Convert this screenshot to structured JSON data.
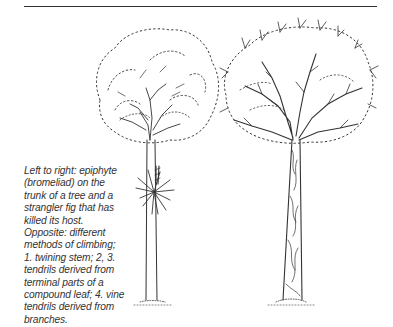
{
  "page": {
    "caption": {
      "lines": [
        "Left to right: epiphyte",
        "(bromeliad) on the",
        "trunk of a tree and a",
        "strangler fig that has",
        "killed its host.",
        "Opposite: different",
        "methods of climbing;",
        "1. twining stem; 2, 3.",
        "tendrils derived from",
        "terminal parts of a",
        "compound leaf; 4. vine",
        "tendrils derived from",
        "branches."
      ]
    },
    "illustration": {
      "left_tree": "tree-with-bromeliad-epiphyte",
      "right_tree": "strangler-fig-tree",
      "ink_color": "#222222"
    }
  }
}
